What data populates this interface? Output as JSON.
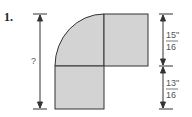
{
  "problem": {
    "number": "1.",
    "unknown_label": "?",
    "dimensions": [
      {
        "numerator": "15\"",
        "denominator": "16"
      },
      {
        "numerator": "13\"",
        "denominator": "16"
      }
    ]
  },
  "colors": {
    "fill": "#d3d3d3",
    "stroke": "#333333"
  }
}
